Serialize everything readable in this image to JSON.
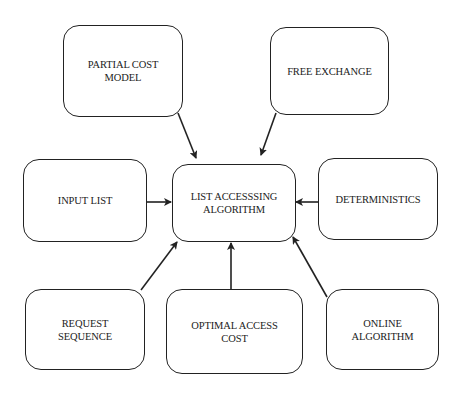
{
  "diagram": {
    "type": "concept-map",
    "center": {
      "id": "list-accessing-algorithm",
      "label": "LIST ACCESSSING\nALGORITHM"
    },
    "nodes": [
      {
        "id": "partial-cost-model",
        "label": "PARTIAL COST\nMODEL"
      },
      {
        "id": "free-exchange",
        "label": "FREE EXCHANGE"
      },
      {
        "id": "input-list",
        "label": "INPUT LIST"
      },
      {
        "id": "deterministics",
        "label": "DETERMINISTICS"
      },
      {
        "id": "request-sequence",
        "label": "REQUEST\nSEQUENCE"
      },
      {
        "id": "optimal-access-cost",
        "label": "OPTIMAL ACCESS\nCOST"
      },
      {
        "id": "online-algorithm",
        "label": "ONLINE\nALGORITHM"
      }
    ],
    "edges": [
      {
        "from": "partial-cost-model",
        "to": "list-accessing-algorithm"
      },
      {
        "from": "free-exchange",
        "to": "list-accessing-algorithm"
      },
      {
        "from": "input-list",
        "to": "list-accessing-algorithm"
      },
      {
        "from": "deterministics",
        "to": "list-accessing-algorithm"
      },
      {
        "from": "request-sequence",
        "to": "list-accessing-algorithm"
      },
      {
        "from": "optimal-access-cost",
        "to": "list-accessing-algorithm"
      },
      {
        "from": "online-algorithm",
        "to": "list-accessing-algorithm"
      }
    ],
    "colors": {
      "stroke": "#222222",
      "background": "#ffffff",
      "text": "#222222"
    }
  }
}
